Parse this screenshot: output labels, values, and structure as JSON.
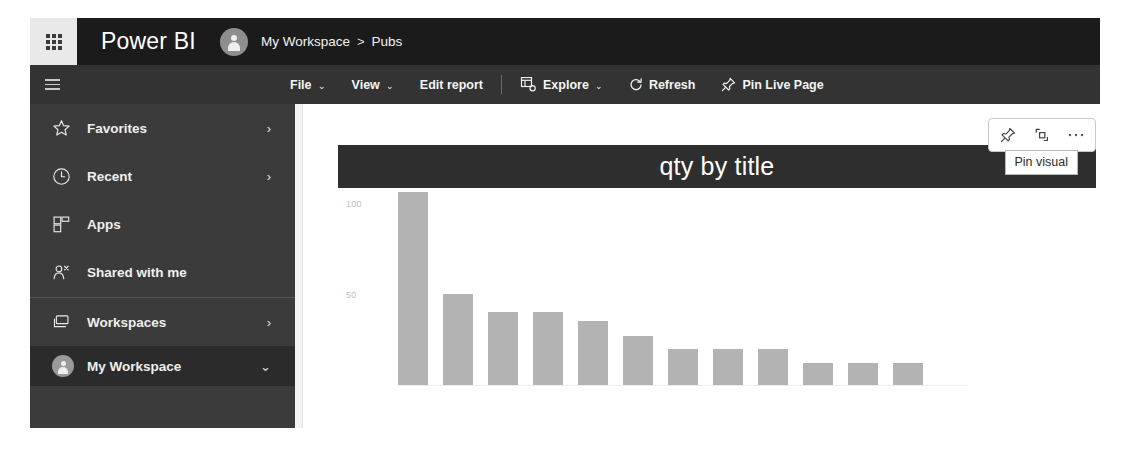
{
  "header": {
    "waffle_icon": "waffle-grid-icon",
    "brand": "Power BI",
    "avatar_icon": "user-avatar-icon",
    "breadcrumb": {
      "workspace": "My Workspace",
      "separator": ">",
      "item": "Pubs"
    }
  },
  "commandbar": {
    "hamburger_icon": "hamburger-menu-icon",
    "items": [
      {
        "label": "File",
        "chevron": "⌄",
        "icon": null
      },
      {
        "label": "View",
        "chevron": "⌄",
        "icon": null
      },
      {
        "label": "Edit report",
        "chevron": "",
        "icon": null
      },
      {
        "label": "Explore",
        "chevron": "⌄",
        "icon": "explore-icon"
      },
      {
        "label": "Refresh",
        "chevron": "",
        "icon": "refresh-icon"
      },
      {
        "label": "Pin Live Page",
        "chevron": "",
        "icon": "pin-icon"
      }
    ]
  },
  "sidebar": {
    "items": [
      {
        "label": "Favorites",
        "icon": "star-icon",
        "chevron": "›",
        "selected": false
      },
      {
        "label": "Recent",
        "icon": "clock-icon",
        "chevron": "›",
        "selected": false
      },
      {
        "label": "Apps",
        "icon": "apps-icon",
        "chevron": "",
        "selected": false
      },
      {
        "label": "Shared with me",
        "icon": "shared-with-me-icon",
        "chevron": "",
        "selected": false
      },
      {
        "label": "Workspaces",
        "icon": "workspaces-icon",
        "chevron": "›",
        "selected": false
      },
      {
        "label": "My Workspace",
        "icon": "user-avatar-icon",
        "chevron": "⌄",
        "selected": true
      }
    ]
  },
  "visual": {
    "title": "qty by title",
    "toolbar": [
      {
        "name": "pin-visual-button",
        "icon": "pin-icon"
      },
      {
        "name": "focus-mode-button",
        "icon": "focus-mode-icon"
      },
      {
        "name": "more-options-button",
        "icon": "ellipsis-icon"
      }
    ],
    "tooltip": "Pin visual"
  },
  "colors": {
    "header_bg": "#1b1b1b",
    "commandbar_bg": "#333333",
    "sidebar_bg": "#3b3b3b",
    "sidebar_selected_bg": "#2b2b2b",
    "visual_title_bg": "#2e2e2e",
    "bar_fill": "#b3b3b3",
    "canvas_bg": "#ffffff"
  },
  "chart_data": {
    "type": "bar",
    "title": "qty by title",
    "xlabel": "",
    "ylabel": "",
    "ylim": [
      0,
      110
    ],
    "yticks": [
      50,
      100
    ],
    "ytick_labels": [
      "50",
      "100"
    ],
    "grid": false,
    "legend": null,
    "categories": [
      "1",
      "2",
      "3",
      "4",
      "5",
      "6",
      "7",
      "8",
      "9",
      "10",
      "11",
      "12"
    ],
    "values": [
      106,
      50,
      40,
      40,
      35,
      27,
      20,
      20,
      20,
      12,
      12,
      12
    ]
  }
}
